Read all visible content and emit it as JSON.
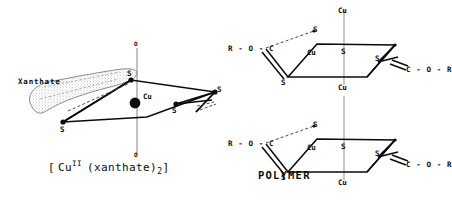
{
  "figure": {
    "background_color": "#ffffff",
    "ink_color": "#0b0b0b",
    "left_panel": {
      "name": "copper-xanthate-complex",
      "callout_label": "Xanthate",
      "center_atom": "Cu",
      "axial_atom_top": "O",
      "axial_atom_bottom": "O",
      "sulfur_labels": [
        "S",
        "S",
        "S",
        "S"
      ],
      "caption": {
        "open_bracket": "[",
        "metal": "Cu",
        "oxidation_state": "II",
        "ligand": "(xanthate)",
        "ligand_count": "2",
        "close_bracket": "]"
      }
    },
    "right_panel": {
      "name": "polymer-chain",
      "label": "POLYMER",
      "units": [
        {
          "name": "polymer-unit-upper",
          "axial_top": "Cu",
          "axial_bottom": "Cu",
          "center_atom": "Cu",
          "inner_sulfur": "S",
          "sulfur_upper_left": "S",
          "sulfur_lower_left": "S",
          "sulfur_right": "S",
          "left_chain": [
            "R",
            "O",
            "C"
          ],
          "left_chain_text": "R - O - C",
          "right_chain": [
            "C",
            "O",
            "R"
          ],
          "right_chain_text": "C - O - R"
        },
        {
          "name": "polymer-unit-lower",
          "axial_top": "Cu",
          "axial_bottom": "Cu",
          "center_atom": "Cu",
          "inner_sulfur": "S",
          "sulfur_upper_left": "S",
          "sulfur_lower_left": "S",
          "sulfur_right": "S",
          "left_chain": [
            "R",
            "O",
            "C"
          ],
          "left_chain_text": "R - O - C",
          "right_chain": [
            "C",
            "O",
            "R"
          ],
          "right_chain_text": "C - O - R"
        }
      ]
    }
  }
}
